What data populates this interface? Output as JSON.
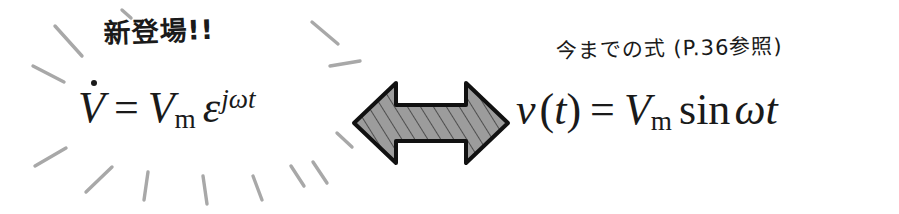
{
  "page": {
    "background_color": "#ffffff",
    "width": 899,
    "height": 214
  },
  "left_panel": {
    "label": "新登場!!",
    "label_name": "new-arrival-callout",
    "formula": {
      "name": "phasor-voltage-equation",
      "lhs_symbol": "V",
      "lhs_accent": "dot",
      "equals": "=",
      "rhs_base": "V",
      "rhs_subscript": "m",
      "rhs_factor": "ε",
      "rhs_exponent": "jωt",
      "plain_text": "V̇ = Vm ε^(jωt)"
    },
    "sunburst": {
      "name": "sunburst-rays",
      "ray_color": "#a6a6a6",
      "ray_count": 13
    }
  },
  "center": {
    "arrow": {
      "name": "double-headed-arrow",
      "direction": "bidirectional",
      "fill_color": "#9a9a9a",
      "hatch_color": "#4a4a4a",
      "outline_color": "#121212"
    }
  },
  "right_panel": {
    "label": "今までの式 (P.36参照)",
    "label_name": "previous-equation-caption",
    "page_reference": "P.36",
    "formula": {
      "name": "instantaneous-voltage-equation",
      "lhs_symbol": "v",
      "lhs_argument": "t",
      "equals": "=",
      "rhs_base": "V",
      "rhs_subscript": "m",
      "rhs_function": "sin",
      "rhs_argument": "ωt",
      "plain_text": "v(t) = Vm sin ωt"
    }
  },
  "glyphs": {
    "epsilon": "ε",
    "omega": "ω",
    "open_paren": "(",
    "close_paren": ")",
    "equals": "=",
    "sin": "sin"
  }
}
